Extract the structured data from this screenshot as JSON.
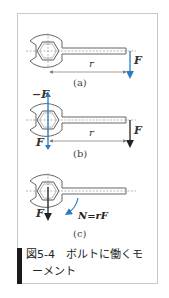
{
  "figure": {
    "caption_line1": "図5-4　ボルトに働くモ",
    "caption_line2": "ーメント",
    "panels": [
      {
        "id": "a",
        "label": "(a)",
        "force_label": "F",
        "distance_label": "r",
        "force_color": "#2b7bc0"
      },
      {
        "id": "b",
        "label": "(b)",
        "force_label": "F",
        "neg_force_label": "−F",
        "distance_label": "r",
        "couple_color": "#2b7bc0",
        "force_color": "#222222"
      },
      {
        "id": "c",
        "label": "(c)",
        "force_label": "F",
        "moment_label": "N=rF",
        "moment_color": "#2b7bc0",
        "force_color": "#222222"
      }
    ]
  }
}
